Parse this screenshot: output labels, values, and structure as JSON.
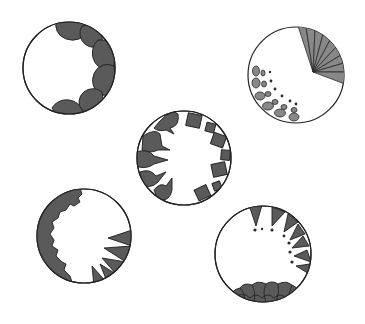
{
  "figure": {
    "description": "Five circular cross-section diagrams with different peripheral shape patterns",
    "colors": {
      "background": "#ffffff",
      "outline": "#222222",
      "dark_fill": "#5a5a5a",
      "mid_fill": "#888888"
    },
    "circles": [
      {
        "id": "top-left",
        "cx": 69,
        "cy": 68,
        "r": 46,
        "pattern": "scalloped dome lobes along right rim",
        "lobe_count": 6
      },
      {
        "id": "top-right",
        "cx": 296,
        "cy": 75,
        "r": 48,
        "pattern": "radial fan wedge upper-right plus graded ellipses lower-left",
        "fan_segments": 9
      },
      {
        "id": "center",
        "cx": 184,
        "cy": 158,
        "r": 47,
        "pattern": "lobes with tails on left, squares on right",
        "lobe_count": 5,
        "square_count": 8
      },
      {
        "id": "bottom-left",
        "cx": 84,
        "cy": 236,
        "r": 47,
        "pattern": "serrated lobes on left, triangular teeth lower-right",
        "teeth_count": 5
      },
      {
        "id": "bottom-right",
        "cx": 263,
        "cy": 254,
        "r": 48,
        "pattern": "triangles with dots on upper-right, packed lobes along bottom",
        "triangle_count": 7
      }
    ]
  }
}
